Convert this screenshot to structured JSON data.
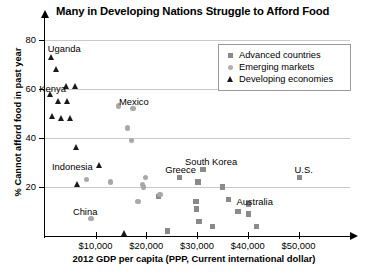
{
  "chart_data": {
    "type": "scatter",
    "title": "Many in Developing Nations Struggle to Afford Food",
    "xlabel": "2012 GDP per capita (PPP, Current international dollar)",
    "ylabel": "% Cannot afford food in past year",
    "xlim": [
      0,
      60000
    ],
    "ylim": [
      0,
      88
    ],
    "grid": true,
    "legend_position": "top-right",
    "xticks": [
      {
        "value": 10000,
        "label": "$10,000"
      },
      {
        "value": 20000,
        "label": "$20,000"
      },
      {
        "value": 30000,
        "label": "$30,000"
      },
      {
        "value": 40000,
        "label": "$40,000"
      },
      {
        "value": 50000,
        "label": "$50,000"
      }
    ],
    "yticks": [
      {
        "value": 20,
        "label": "20"
      },
      {
        "value": 40,
        "label": "40"
      },
      {
        "value": 60,
        "label": "60"
      },
      {
        "value": 80,
        "label": "80"
      }
    ],
    "series": [
      {
        "name": "Advanced countries",
        "marker": "square",
        "color": "#8a8a8a",
        "points": [
          {
            "x": 26500,
            "y": 24,
            "label": "Greece"
          },
          {
            "x": 30200,
            "y": 22,
            "label": ""
          },
          {
            "x": 31200,
            "y": 27,
            "label": "South Korea"
          },
          {
            "x": 35100,
            "y": 20,
            "label": ""
          },
          {
            "x": 36200,
            "y": 15,
            "label": "Australia"
          },
          {
            "x": 29800,
            "y": 14,
            "label": ""
          },
          {
            "x": 29900,
            "y": 11,
            "label": ""
          },
          {
            "x": 30400,
            "y": 6,
            "label": ""
          },
          {
            "x": 33000,
            "y": 4,
            "label": ""
          },
          {
            "x": 38100,
            "y": 10,
            "label": ""
          },
          {
            "x": 40100,
            "y": 13,
            "label": ""
          },
          {
            "x": 40200,
            "y": 9,
            "label": ""
          },
          {
            "x": 41700,
            "y": 4,
            "label": ""
          },
          {
            "x": 50200,
            "y": 24,
            "label": "U.S."
          },
          {
            "x": 22400,
            "y": 16,
            "label": ""
          },
          {
            "x": 24200,
            "y": 2,
            "label": ""
          }
        ]
      },
      {
        "name": "Emerging markets",
        "marker": "circle",
        "color": "#a8a8a8",
        "points": [
          {
            "x": 14600,
            "y": 53,
            "label": ""
          },
          {
            "x": 17400,
            "y": 52,
            "label": "Mexico"
          },
          {
            "x": 16300,
            "y": 44,
            "label": ""
          },
          {
            "x": 17100,
            "y": 39,
            "label": ""
          },
          {
            "x": 8300,
            "y": 23,
            "label": ""
          },
          {
            "x": 12900,
            "y": 22,
            "label": ""
          },
          {
            "x": 19800,
            "y": 24,
            "label": ""
          },
          {
            "x": 19300,
            "y": 21,
            "label": ""
          },
          {
            "x": 19500,
            "y": 20,
            "label": ""
          },
          {
            "x": 18400,
            "y": 14,
            "label": ""
          },
          {
            "x": 9100,
            "y": 7,
            "label": "China"
          },
          {
            "x": 22700,
            "y": 17,
            "label": ""
          }
        ]
      },
      {
        "name": "Developing economies",
        "marker": "triangle",
        "color": "#1a1a1a",
        "points": [
          {
            "x": 1400,
            "y": 73,
            "label": "Uganda"
          },
          {
            "x": 2300,
            "y": 68,
            "label": ""
          },
          {
            "x": 4400,
            "y": 61,
            "label": ""
          },
          {
            "x": 6200,
            "y": 61,
            "label": ""
          },
          {
            "x": 1300,
            "y": 58,
            "label": "Kenya"
          },
          {
            "x": 2800,
            "y": 55,
            "label": ""
          },
          {
            "x": 4600,
            "y": 55,
            "label": ""
          },
          {
            "x": 1700,
            "y": 49,
            "label": ""
          },
          {
            "x": 3300,
            "y": 48,
            "label": ""
          },
          {
            "x": 5200,
            "y": 48,
            "label": ""
          },
          {
            "x": 6400,
            "y": 36,
            "label": ""
          },
          {
            "x": 10900,
            "y": 29,
            "label": "Indonesia"
          },
          {
            "x": 6600,
            "y": 21,
            "label": ""
          },
          {
            "x": 15700,
            "y": 1,
            "label": ""
          }
        ]
      }
    ]
  }
}
